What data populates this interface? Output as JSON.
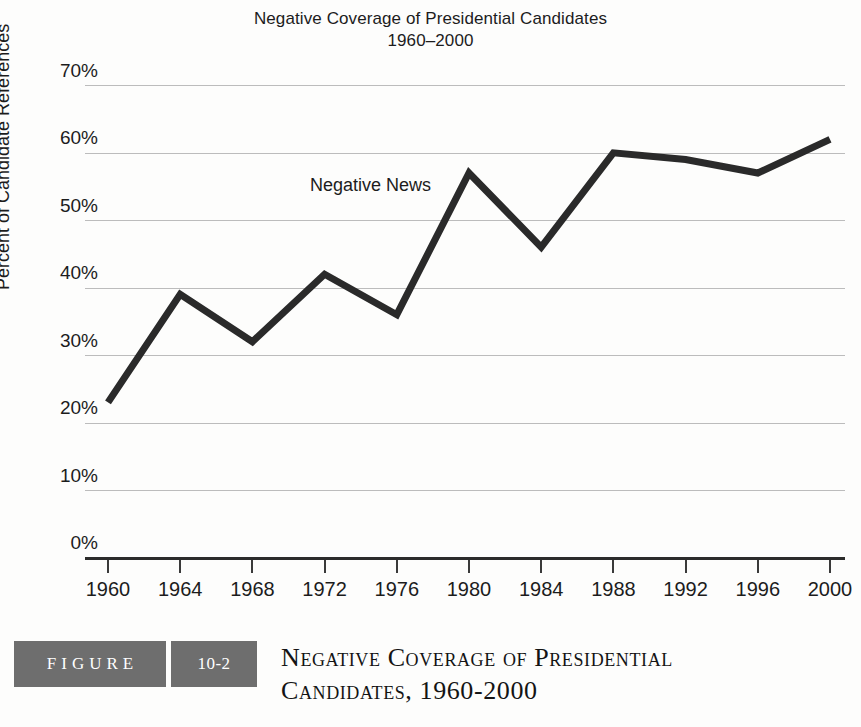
{
  "chart_data": {
    "type": "line",
    "title": "Negative Coverage of Presidential Candidates",
    "subtitle": "1960–2000",
    "xlabel": "",
    "ylabel": "Percent of Candidate References",
    "categories": [
      "1960",
      "1964",
      "1968",
      "1972",
      "1976",
      "1980",
      "1984",
      "1988",
      "1992",
      "1996",
      "2000"
    ],
    "series": [
      {
        "name": "Negative News",
        "values": [
          23,
          39,
          32,
          42,
          36,
          57,
          46,
          60,
          59,
          57,
          62
        ]
      }
    ],
    "ylim": [
      0,
      70
    ],
    "ytick_labels": [
      "70%",
      "60%",
      "50%",
      "40%",
      "30%",
      "20%",
      "10%",
      "0%"
    ],
    "ytick_values": [
      70,
      60,
      50,
      40,
      30,
      20,
      10,
      0
    ],
    "grid": true,
    "legend_position": "inline-annotation",
    "annotations": [
      {
        "text": "Negative News",
        "x": "1972",
        "y": 52
      }
    ],
    "line_color": "#2a2a2a",
    "grid_color": "#bcbcbc",
    "background_color": "#fdfdfc"
  },
  "caption": {
    "figure_word": "FIGURE",
    "figure_number": "10-2",
    "title_line1": "Negative Coverage of Presidential",
    "title_line2": "Candidates, 1960-2000",
    "box_color": "#6e6e6e"
  }
}
